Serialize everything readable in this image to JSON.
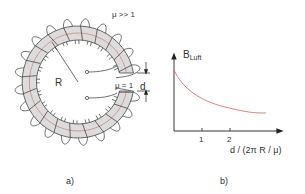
{
  "figure_a": {
    "label_mu_core": "μ >> 1",
    "label_mu_gap": "μ = 1",
    "label_radius": "R",
    "label_gap_width": "d",
    "caption": "a)",
    "colors": {
      "core_fill": "#dcdcdc",
      "core_midline": "#c98a85",
      "wire": "#333333"
    }
  },
  "figure_b": {
    "y_axis_label_main": "B",
    "y_axis_label_sub": "Luft",
    "x_axis_label": "d / (2π R / μ)",
    "x_ticks": [
      "1",
      "2"
    ],
    "caption": "b)",
    "colors": {
      "curve": "#d9726d",
      "axis": "#222222"
    }
  },
  "chart_data": {
    "type": "line",
    "title": "",
    "xlabel": "d / (2π R / μ)",
    "ylabel": "B_Luft",
    "x_ticks": [
      1,
      2
    ],
    "series": [
      {
        "name": "B_Luft",
        "x": [
          0,
          0.5,
          1,
          1.5,
          2,
          2.5,
          3.2
        ],
        "values": [
          1.0,
          0.78,
          0.62,
          0.51,
          0.44,
          0.4,
          0.37
        ]
      }
    ],
    "grid": false,
    "legend": "none"
  }
}
